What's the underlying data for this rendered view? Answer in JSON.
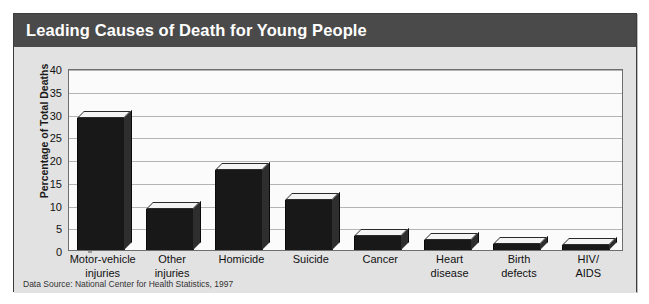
{
  "figure": {
    "title": "Leading Causes of Death for Young People",
    "source_note": "Data Source: National Center for Health Statistics, 1997",
    "title_bar_color": "#4a4a4a",
    "bar_color": "#181818",
    "plot_background": "#fbfbfb",
    "panel_background": "#e2e2e2",
    "gridline_color": "#b4b4b4"
  },
  "chart_data": {
    "type": "bar",
    "title": "Leading Causes of Death for Young People",
    "xlabel": "",
    "ylabel": "Percentage of Total Deaths",
    "ylim": [
      0,
      40
    ],
    "ytick_step": 5,
    "yticks": [
      0,
      5,
      10,
      15,
      20,
      25,
      30,
      35,
      40
    ],
    "ytick_labels": [
      "0",
      "5",
      "10",
      "15",
      "20",
      "25",
      "30",
      "35",
      "40"
    ],
    "grid": true,
    "legend": false,
    "categories": [
      "Motor-vehicle injuries",
      "Other injuries",
      "Homicide",
      "Suicide",
      "Cancer",
      "Heart disease",
      "Birth defects",
      "HIV/ AIDS"
    ],
    "category_lines": [
      [
        "Motor-vehicle",
        "injuries"
      ],
      [
        "Other",
        "injuries"
      ],
      [
        "Homicide",
        ""
      ],
      [
        "Suicide",
        ""
      ],
      [
        "Cancer",
        ""
      ],
      [
        "Heart",
        "disease"
      ],
      [
        "Birth",
        "defects"
      ],
      [
        "HIV/",
        "AIDS"
      ]
    ],
    "values": [
      29,
      9,
      17.5,
      11,
      3,
      2.2,
      1.3,
      1
    ]
  }
}
